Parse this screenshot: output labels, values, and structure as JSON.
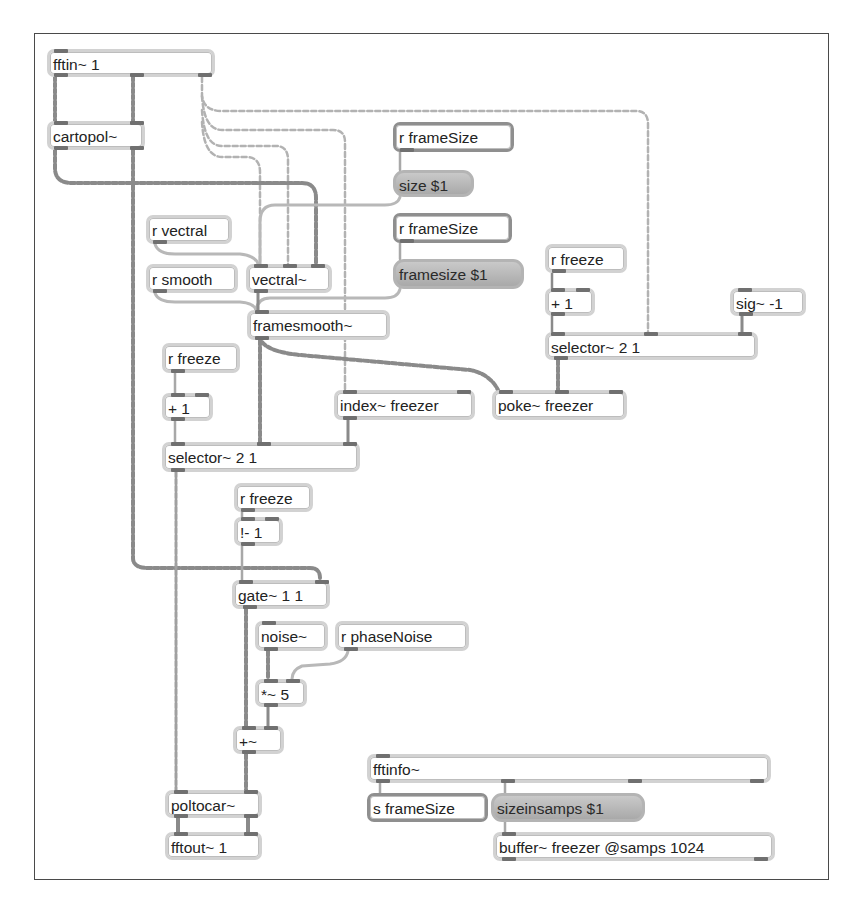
{
  "patcher": {
    "colors": {
      "frame": "#4a4a4a",
      "object_border": "#d2d2d2",
      "message_fill": "#b5b5b5",
      "port": "#707070",
      "signal_cord": "#8a8a8a",
      "control_cord": "#b0b0b0"
    },
    "objects": [
      {
        "id": "fftin",
        "text": "fftin~ 1",
        "type": "object",
        "x": 47,
        "y": 49,
        "w": 168,
        "h": 28
      },
      {
        "id": "cartopol",
        "text": "cartopol~",
        "type": "object",
        "x": 47,
        "y": 121,
        "w": 98,
        "h": 29
      },
      {
        "id": "r_framesize_1",
        "text": "r frameSize",
        "type": "send",
        "x": 393,
        "y": 122,
        "w": 121,
        "h": 30
      },
      {
        "id": "size_msg",
        "text": "size $1",
        "type": "message",
        "x": 393,
        "y": 170,
        "w": 81,
        "h": 27
      },
      {
        "id": "r_framesize_2",
        "text": "r frameSize",
        "type": "send",
        "x": 393,
        "y": 213,
        "w": 119,
        "h": 30
      },
      {
        "id": "framesize_msg",
        "text": "framesize $1",
        "type": "message",
        "x": 393,
        "y": 259,
        "w": 131,
        "h": 30
      },
      {
        "id": "r_vectral",
        "text": "r vectral",
        "type": "object",
        "x": 146,
        "y": 215,
        "w": 86,
        "h": 29
      },
      {
        "id": "r_smooth",
        "text": "r smooth",
        "type": "object",
        "x": 146,
        "y": 264,
        "w": 92,
        "h": 29
      },
      {
        "id": "vectral",
        "text": "vectral~",
        "type": "object",
        "x": 246,
        "y": 264,
        "w": 86,
        "h": 29
      },
      {
        "id": "framesmooth",
        "text": "framesmooth~",
        "type": "object",
        "x": 247,
        "y": 310,
        "w": 143,
        "h": 30
      },
      {
        "id": "r_freeze_right",
        "text": "r freeze",
        "type": "object",
        "x": 545,
        "y": 244,
        "w": 82,
        "h": 29
      },
      {
        "id": "plus1_right",
        "text": "+ 1",
        "type": "object",
        "x": 545,
        "y": 288,
        "w": 50,
        "h": 28
      },
      {
        "id": "sig_neg1",
        "text": "sig~ -1",
        "type": "object",
        "x": 730,
        "y": 288,
        "w": 76,
        "h": 28
      },
      {
        "id": "selector_right",
        "text": "selector~ 2 1",
        "type": "object",
        "x": 545,
        "y": 332,
        "w": 213,
        "h": 28
      },
      {
        "id": "r_freeze_left",
        "text": "r freeze",
        "type": "object",
        "x": 162,
        "y": 343,
        "w": 78,
        "h": 30
      },
      {
        "id": "plus1_left",
        "text": "+ 1",
        "type": "object",
        "x": 162,
        "y": 393,
        "w": 51,
        "h": 28
      },
      {
        "id": "index_freezer",
        "text": "index~ freezer",
        "type": "object",
        "x": 334,
        "y": 390,
        "w": 141,
        "h": 30
      },
      {
        "id": "poke_freezer",
        "text": "poke~ freezer",
        "type": "object",
        "x": 492,
        "y": 390,
        "w": 135,
        "h": 30
      },
      {
        "id": "selector_left",
        "text": "selector~ 2 1",
        "type": "object",
        "x": 162,
        "y": 442,
        "w": 198,
        "h": 30
      },
      {
        "id": "r_freeze_mid",
        "text": "r freeze",
        "type": "object",
        "x": 234,
        "y": 483,
        "w": 79,
        "h": 29
      },
      {
        "id": "not_minus1",
        "text": "!- 1",
        "type": "object",
        "x": 234,
        "y": 517,
        "w": 49,
        "h": 29
      },
      {
        "id": "gate",
        "text": "gate~ 1 1",
        "type": "object",
        "x": 232,
        "y": 580,
        "w": 98,
        "h": 29
      },
      {
        "id": "noise",
        "text": "noise~",
        "type": "object",
        "x": 255,
        "y": 621,
        "w": 73,
        "h": 30
      },
      {
        "id": "r_phasenoise",
        "text": "r phaseNoise",
        "type": "object",
        "x": 335,
        "y": 621,
        "w": 134,
        "h": 30
      },
      {
        "id": "times5",
        "text": "*~ 5",
        "type": "object",
        "x": 255,
        "y": 679,
        "w": 52,
        "h": 28
      },
      {
        "id": "plus_sig",
        "text": "+~",
        "type": "object",
        "x": 233,
        "y": 726,
        "w": 51,
        "h": 28
      },
      {
        "id": "poltocar",
        "text": "poltocar~",
        "type": "object",
        "x": 165,
        "y": 790,
        "w": 97,
        "h": 28
      },
      {
        "id": "fftout",
        "text": "fftout~ 1",
        "type": "object",
        "x": 165,
        "y": 832,
        "w": 97,
        "h": 28
      },
      {
        "id": "fftinfo",
        "text": "fftinfo~",
        "type": "object",
        "x": 367,
        "y": 754,
        "w": 404,
        "h": 29
      },
      {
        "id": "s_framesize",
        "text": "s frameSize",
        "type": "send",
        "x": 367,
        "y": 793,
        "w": 121,
        "h": 29
      },
      {
        "id": "sizeinsamps_msg",
        "text": "sizeinsamps $1",
        "type": "message",
        "x": 491,
        "y": 793,
        "w": 154,
        "h": 29
      },
      {
        "id": "buffer",
        "text": "buffer~ freezer @samps 1024",
        "type": "object",
        "x": 493,
        "y": 832,
        "w": 282,
        "h": 29
      }
    ]
  }
}
